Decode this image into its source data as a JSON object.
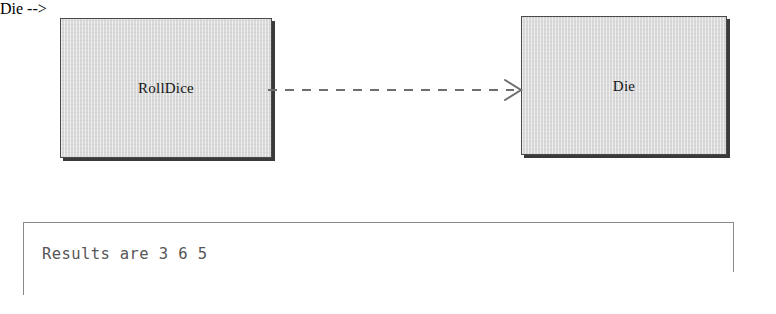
{
  "diagram": {
    "type": "uml-dependency",
    "background_color": "#ffffff",
    "nodes": [
      {
        "id": "rolldice",
        "label": "RollDice",
        "shape": "rectangle",
        "fill_color": "#d9d9d9",
        "border_color": "#4a4a4a",
        "shadow_color": "#3a3a3a"
      },
      {
        "id": "die",
        "label": "Die",
        "shape": "rectangle",
        "fill_color": "#d9d9d9",
        "border_color": "#4a4a4a",
        "shadow_color": "#3a3a3a"
      }
    ],
    "edges": [
      {
        "id": "rolldice-uses-die",
        "from": "rolldice",
        "to": "die",
        "line_style": "dashed",
        "arrowhead": "open",
        "color": "#6e6e6e",
        "label": ""
      }
    ]
  },
  "console": {
    "output_line": "Results are 3 6 5",
    "border_color": "#8a8a8a",
    "text_color": "#565656"
  }
}
